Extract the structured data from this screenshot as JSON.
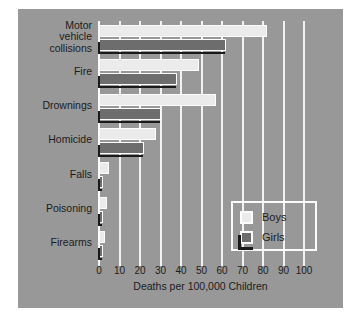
{
  "chart_data": {
    "type": "bar",
    "orientation": "horizontal",
    "title": "",
    "xlabel": "Deaths per 100,000 Children",
    "ylabel": "",
    "xlim": [
      0,
      100
    ],
    "xticks": [
      0,
      10,
      20,
      30,
      40,
      50,
      60,
      70,
      80,
      90,
      100
    ],
    "xtick_labels": [
      "0",
      "10",
      "20",
      "30",
      "40",
      "50",
      "60",
      "70",
      "80",
      "90",
      "100"
    ],
    "grid": true,
    "legend_position": "lower-right",
    "categories": [
      "Motor\nvehicle\ncollisions",
      "Fire",
      "Drownings",
      "Homicide",
      "Falls",
      "Poisoning",
      "Firearms"
    ],
    "category_labels": [
      [
        "Motor",
        "vehicle",
        "collisions"
      ],
      [
        "Fire"
      ],
      [
        "Drownings"
      ],
      [
        "Homicide"
      ],
      [
        "Falls"
      ],
      [
        "Poisoning"
      ],
      [
        "Firearms"
      ]
    ],
    "series": [
      {
        "name": "Boys",
        "color": "#ebebeb",
        "values": [
          82,
          49,
          57,
          28,
          5,
          4,
          3
        ]
      },
      {
        "name": "Girls",
        "color": "#6d6d6d",
        "values": [
          62,
          38,
          30,
          22,
          2,
          2,
          1.5
        ]
      }
    ]
  },
  "legend": {
    "entries": [
      {
        "label": "Boys",
        "swatch": "light-swatch"
      },
      {
        "label": "Girls",
        "swatch": "dark-swatch"
      }
    ]
  },
  "axis": {
    "x_title": "Deaths per 100,000 Children"
  },
  "colors": {
    "panel_background": "#989898",
    "page_background": "#ffffff",
    "gridline": "#f2f2f2",
    "boys_bar": "#ebebeb",
    "girls_bar": "#6d6d6d",
    "girls_shadow": "#1a1a1a",
    "text": "#1c1c1c"
  }
}
